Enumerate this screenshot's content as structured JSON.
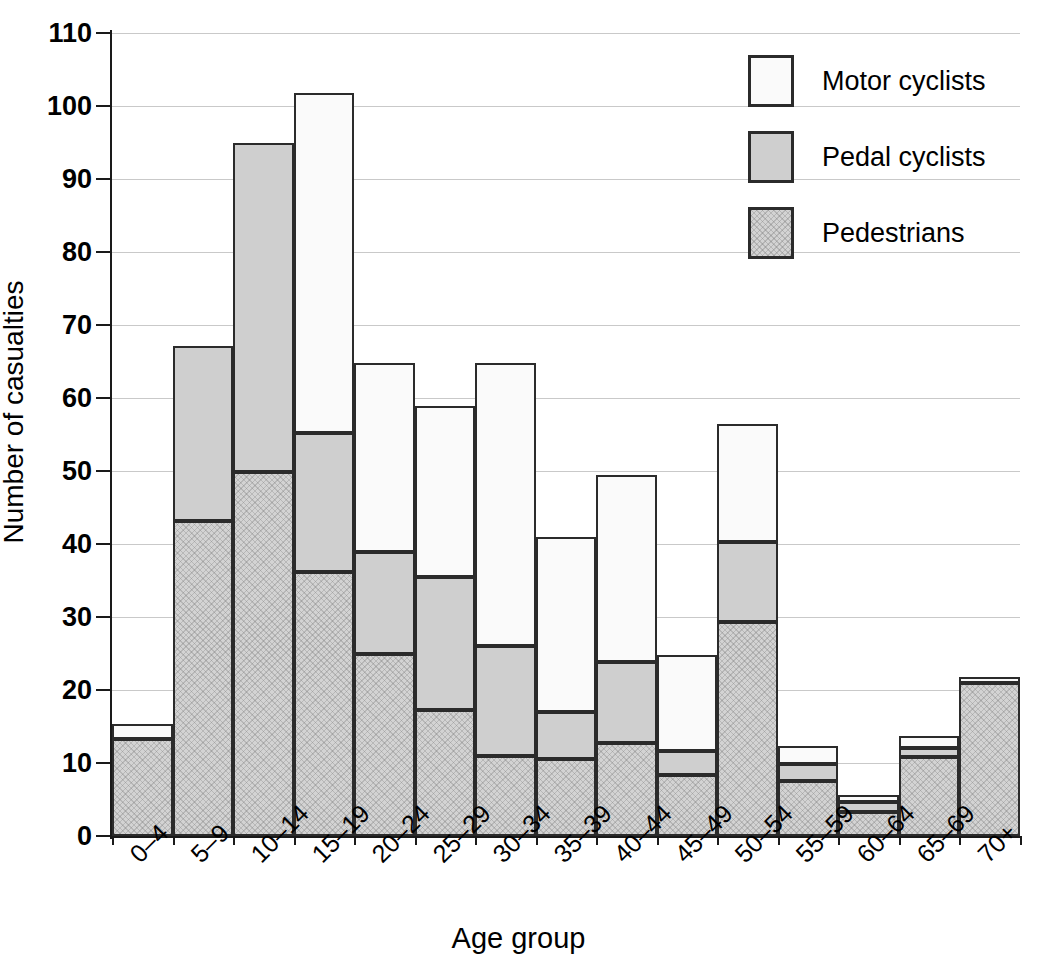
{
  "chart_data": {
    "type": "bar",
    "subtype": "stacked-bar",
    "title": "",
    "xlabel": "Age group",
    "ylabel": "Number of casualties",
    "ylim": [
      0,
      110
    ],
    "ytick_step": 10,
    "yticks": [
      0,
      10,
      20,
      30,
      40,
      50,
      60,
      70,
      80,
      90,
      100,
      110
    ],
    "grid": "horizontal",
    "legend_position": "top-right",
    "categories": [
      "0–4",
      "5–9",
      "10–14",
      "15–19",
      "20–24",
      "25–29",
      "30–34",
      "35–39",
      "40–44",
      "45–49",
      "50–54",
      "55–59",
      "60–64",
      "65–69",
      "70+"
    ],
    "series": [
      {
        "name": "Pedestrians",
        "order": 0,
        "color": "#d3d3d3",
        "pattern": "cross-hatch",
        "values": [
          13.3,
          43.2,
          49.8,
          36.1,
          24.9,
          17.2,
          10.9,
          10.6,
          12.7,
          8.4,
          29.3,
          7.5,
          3.3,
          10.8,
          21.0
        ]
      },
      {
        "name": "Pedal cyclists",
        "order": 1,
        "color": "#cfcfcf",
        "pattern": "solid",
        "values": [
          0.0,
          23.9,
          45.2,
          19.1,
          14.0,
          18.3,
          15.1,
          6.4,
          11.1,
          3.3,
          11.0,
          2.3,
          1.3,
          1.3,
          0.0
        ]
      },
      {
        "name": "Motor cyclists",
        "order": 2,
        "color": "#fafafa",
        "pattern": "solid",
        "values": [
          2.1,
          0.0,
          0.0,
          46.6,
          25.9,
          23.4,
          38.8,
          23.9,
          25.7,
          13.1,
          16.2,
          2.5,
          1.0,
          1.6,
          0.8
        ]
      }
    ],
    "totals": [
      15.4,
      67.1,
      95.0,
      101.8,
      64.8,
      58.9,
      64.8,
      40.9,
      49.5,
      24.8,
      56.5,
      12.3,
      5.6,
      13.7,
      21.8
    ]
  },
  "legend": {
    "items": [
      {
        "label": "Motor cyclists",
        "swatch": "motor"
      },
      {
        "label": "Pedal cyclists",
        "swatch": "pedal"
      },
      {
        "label": "Pedestrians",
        "swatch": "ped"
      }
    ]
  },
  "axes": {
    "y_title": "Number of casualties",
    "x_title": "Age group"
  }
}
